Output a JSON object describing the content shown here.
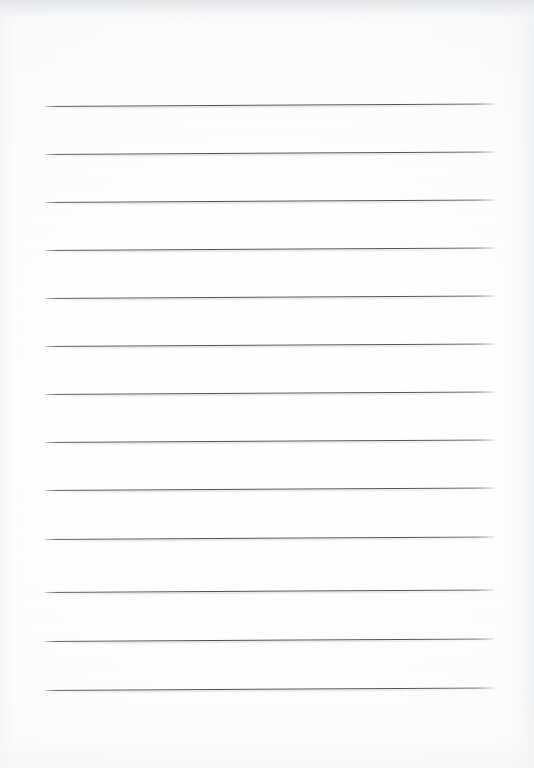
{
  "document": {
    "kind": "scanned-lined-paper",
    "title": "Blank ruled notebook page",
    "page_width": 534,
    "page_height": 768,
    "content_text": "",
    "visible_text": "",
    "is_blank": true
  },
  "paper": {
    "background_color": "#fdfdfd",
    "edge_shade_color": "#eceef0",
    "grain_opacity": 0.5
  },
  "ruling": {
    "line_color": "#54575c",
    "line_thickness_px": 1.25,
    "line_left_px": 44,
    "line_right_px": 494,
    "line_width_px": 450,
    "line_spacing_px": 48,
    "line_tilt_deg": -0.33,
    "line_count": 13,
    "line_y": [
      106,
      154,
      202,
      250,
      298,
      346,
      394,
      442,
      490,
      539,
      592,
      641,
      690
    ],
    "top_margin_px": 106,
    "bottom_margin_px": 78
  },
  "writing_areas": [
    {
      "index": 1,
      "label": "ruled-line-1",
      "y": 106
    },
    {
      "index": 2,
      "label": "ruled-line-2",
      "y": 154
    },
    {
      "index": 3,
      "label": "ruled-line-3",
      "y": 202
    },
    {
      "index": 4,
      "label": "ruled-line-4",
      "y": 250
    },
    {
      "index": 5,
      "label": "ruled-line-5",
      "y": 298
    },
    {
      "index": 6,
      "label": "ruled-line-6",
      "y": 346
    },
    {
      "index": 7,
      "label": "ruled-line-7",
      "y": 394
    },
    {
      "index": 8,
      "label": "ruled-line-8",
      "y": 442
    },
    {
      "index": 9,
      "label": "ruled-line-9",
      "y": 490
    },
    {
      "index": 10,
      "label": "ruled-line-10",
      "y": 539
    },
    {
      "index": 11,
      "label": "ruled-line-11",
      "y": 592
    },
    {
      "index": 12,
      "label": "ruled-line-12",
      "y": 641
    },
    {
      "index": 13,
      "label": "ruled-line-13",
      "y": 690
    }
  ]
}
